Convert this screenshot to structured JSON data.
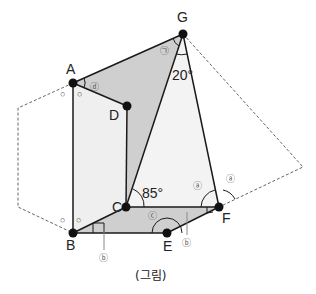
{
  "figure": {
    "caption": "(그림)",
    "colors": {
      "dark_fill": "#cfcfcf",
      "light_fill": "#efefef",
      "line": "#1a1a1a",
      "dashed": "#666666",
      "point": "#111111"
    },
    "points": {
      "A": {
        "label": "A",
        "x": 73,
        "y": 83
      },
      "B": {
        "label": "B",
        "x": 73,
        "y": 233
      },
      "C": {
        "label": "C",
        "x": 126,
        "y": 207
      },
      "D": {
        "label": "D",
        "x": 127,
        "y": 106
      },
      "E": {
        "label": "E",
        "x": 167,
        "y": 233
      },
      "F": {
        "label": "F",
        "x": 219,
        "y": 207
      },
      "G": {
        "label": "G",
        "x": 183,
        "y": 34
      }
    },
    "angles": {
      "angle_C": "85°",
      "angle_G": "20°"
    },
    "markers": {
      "a1": "ⓐ",
      "a2": "ⓐ",
      "b1": "ⓑ",
      "b2": "ⓑ",
      "c": "ⓒ",
      "d": "ⓓ",
      "giyeok": "㉠"
    },
    "equal_marks": [
      "○",
      "○",
      "○",
      "○"
    ]
  }
}
